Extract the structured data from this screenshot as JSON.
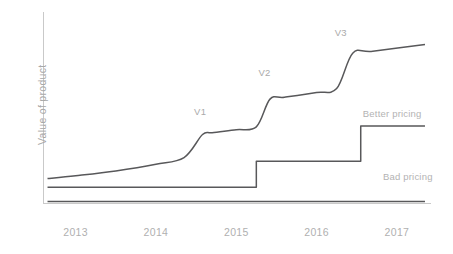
{
  "chart_data": {
    "type": "line",
    "title": "",
    "xlabel": "",
    "ylabel": "Value of product",
    "grid": false,
    "legend_position": "inline-right",
    "xlim": [
      2012.6,
      2017.4
    ],
    "ylim": [
      0,
      100
    ],
    "x_tick_labels": [
      "2013",
      "2014",
      "2015",
      "2016",
      "2017"
    ],
    "x_tick_values": [
      2013,
      2014,
      2015,
      2016,
      2017
    ],
    "y_tick_labels": [],
    "annotations": [
      {
        "text": "V1",
        "x": 2014.55,
        "y": 48
      },
      {
        "text": "V2",
        "x": 2015.35,
        "y": 68
      },
      {
        "text": "V3",
        "x": 2016.3,
        "y": 89
      }
    ],
    "series": [
      {
        "name": "Value of product",
        "label": "",
        "color": "#58585a",
        "style": "smooth-step",
        "points": [
          {
            "x": 2012.65,
            "y": 13.0
          },
          {
            "x": 2013.0,
            "y": 14.5
          },
          {
            "x": 2013.5,
            "y": 17.0
          },
          {
            "x": 2014.0,
            "y": 20.5
          },
          {
            "x": 2014.35,
            "y": 24.0
          },
          {
            "x": 2014.58,
            "y": 36.0
          },
          {
            "x": 2014.7,
            "y": 37.0
          },
          {
            "x": 2015.0,
            "y": 38.5
          },
          {
            "x": 2015.25,
            "y": 40.0
          },
          {
            "x": 2015.42,
            "y": 54.5
          },
          {
            "x": 2015.6,
            "y": 55.5
          },
          {
            "x": 2016.0,
            "y": 58.0
          },
          {
            "x": 2016.25,
            "y": 60.0
          },
          {
            "x": 2016.45,
            "y": 78.5
          },
          {
            "x": 2016.7,
            "y": 79.5
          },
          {
            "x": 2017.35,
            "y": 83.0
          }
        ]
      },
      {
        "name": "Better pricing",
        "label": "Better pricing",
        "color": "#58585a",
        "style": "step",
        "points": [
          {
            "x": 2012.65,
            "y": 8.5
          },
          {
            "x": 2015.25,
            "y": 8.5
          },
          {
            "x": 2015.25,
            "y": 22.0
          },
          {
            "x": 2016.55,
            "y": 22.0
          },
          {
            "x": 2016.55,
            "y": 40.5
          },
          {
            "x": 2017.35,
            "y": 40.5
          }
        ]
      },
      {
        "name": "Bad pricing",
        "label": "Bad pricing",
        "color": "#58585a",
        "style": "flat",
        "points": [
          {
            "x": 2012.65,
            "y": 1.0
          },
          {
            "x": 2017.35,
            "y": 1.0
          }
        ]
      }
    ],
    "series_labels": [
      {
        "text": "Better pricing",
        "x": 2016.7,
        "y": 47.0
      },
      {
        "text": "Bad pricing",
        "x": 2016.95,
        "y": 14.0
      }
    ],
    "colors": {
      "line": "#58585a",
      "axis": "#c9c9c9",
      "tick_text": "#b0b0b0",
      "annotation_text": "#aaaaaa",
      "background": "#ffffff"
    }
  }
}
